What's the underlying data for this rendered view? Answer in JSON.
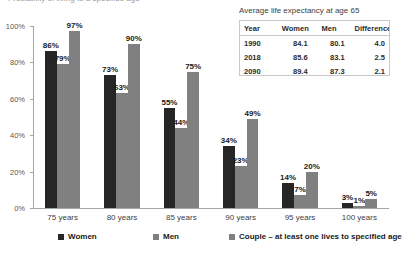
{
  "chart_data": {
    "type": "bar",
    "title": "",
    "xlabel": "",
    "ylabel": "",
    "ylim": [
      0,
      100
    ],
    "grid": false,
    "legend_position": "bottom",
    "categories": [
      "75 years",
      "80 years",
      "85 years",
      "90 years",
      "95 years",
      "100 years"
    ],
    "ytick_labels": [
      "0%",
      "20%",
      "40%",
      "60%",
      "80%",
      "100%"
    ],
    "ytick_values": [
      0,
      20,
      40,
      60,
      80,
      100
    ],
    "series": [
      {
        "name": "Women",
        "color": "#262626",
        "values": [
          86,
          73,
          55,
          34,
          14,
          3
        ],
        "labels": [
          "86%",
          "73%",
          "55%",
          "34%",
          "14%",
          "3%"
        ]
      },
      {
        "name": "Men",
        "color": "#808080",
        "values": [
          79,
          63,
          44,
          23,
          7,
          1
        ],
        "labels": [
          "79%",
          "63%",
          "44%",
          "23%",
          "7%",
          "1%"
        ]
      },
      {
        "name": "Couple – at least one lives to specified age",
        "color": "#808080",
        "values": [
          97,
          90,
          75,
          49,
          20,
          5
        ],
        "labels": [
          "97%",
          "90%",
          "75%",
          "49%",
          "20%",
          "5%"
        ]
      }
    ]
  },
  "title_strip": {
    "text": "Probability of living to a specified age"
  },
  "side_table": {
    "title": "Average life expectancy at age 65",
    "columns": [
      "Year",
      "Women",
      "Men",
      "Difference"
    ],
    "rows": [
      [
        "1990",
        "84.1",
        "80.1",
        "4.0"
      ],
      [
        "2018",
        "85.6",
        "83.1",
        "2.5"
      ],
      [
        "2090",
        "89.4",
        "87.3",
        "2.1"
      ]
    ]
  }
}
